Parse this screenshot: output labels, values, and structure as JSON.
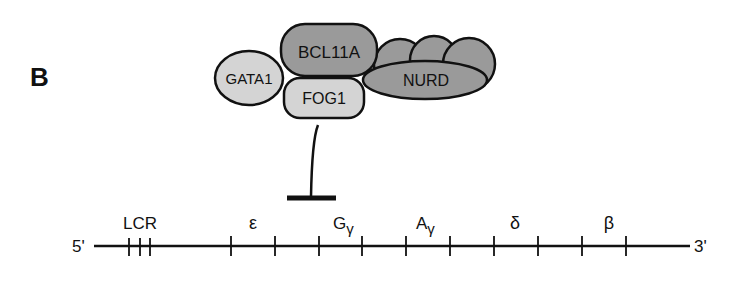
{
  "panel_label": "B",
  "complex": {
    "proteins": [
      {
        "id": "bcl11a",
        "label": "BCL11A",
        "fill": "#9a9a9a"
      },
      {
        "id": "gata1",
        "label": "GATA1",
        "fill": "#d4d4d4"
      },
      {
        "id": "fog1",
        "label": "FOG1",
        "fill": "#d4d4d4"
      },
      {
        "id": "nurd",
        "label": "NURD",
        "fill": "#9a9a9a"
      }
    ],
    "repression_symbol": "inhibition-bar"
  },
  "locus": {
    "five_prime": "5'",
    "three_prime": "3'",
    "regions": [
      {
        "id": "lcr",
        "label": "LCR"
      },
      {
        "id": "epsilon",
        "label": "ε"
      },
      {
        "id": "g-gamma",
        "label": "G",
        "sub": "γ"
      },
      {
        "id": "a-gamma",
        "label": "A",
        "sub": "γ"
      },
      {
        "id": "delta",
        "label": "δ"
      },
      {
        "id": "beta",
        "label": "β"
      }
    ]
  }
}
